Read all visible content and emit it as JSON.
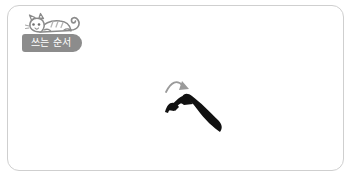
{
  "card": {
    "background_color": "#ffffff",
    "border_color": "#cfcfcf",
    "corner_radius_px": 12
  },
  "mascot": {
    "icon_name": "reclining-cat-illustration",
    "description": "gray tabby cat lying down with curled tail",
    "line_color": "#8a8a8a",
    "fill_color": "#ffffff",
    "stripe_color": "#b5b5b5"
  },
  "label": {
    "text": "쓰는 순서",
    "background_color": "#8c8c8c",
    "text_color": "#ffffff"
  },
  "stroke_diagram": {
    "character_part": "ㅅ",
    "ink_color": "#111111",
    "arrow": {
      "icon_name": "stroke-direction-arrow",
      "color": "#9a9a9a",
      "direction": "right-down"
    },
    "stroke_count": 1,
    "stroke_order_index": 1
  }
}
